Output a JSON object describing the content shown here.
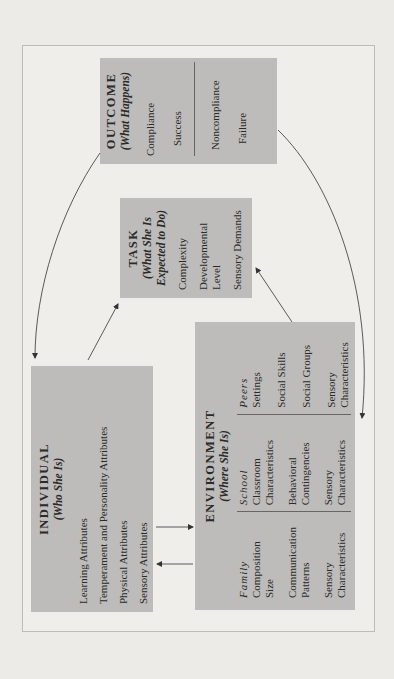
{
  "diagram": {
    "orientation": "rotated-90-ccw",
    "boxes": {
      "outcome": {
        "title": "OUTCOME",
        "subtitle": "(What Happens)",
        "positive": [
          "Compliance",
          "Success"
        ],
        "negative": [
          "Noncompliance",
          "Failure"
        ]
      },
      "task": {
        "title": "TASK",
        "subtitle_line1": "(What She Is",
        "subtitle_line2": "Expected to Do)",
        "items": [
          "Complexity",
          "Developmental",
          "Level",
          "Sensory Demands"
        ]
      },
      "individual": {
        "title": "INDIVIDUAL",
        "subtitle": "(Who She Is)",
        "items": [
          "Learning Attributes",
          "Temperament and Personality Attributes",
          "Physical Attributes",
          "Sensory Attributes"
        ]
      },
      "environment": {
        "title": "ENVIRONMENT",
        "subtitle": "(Where She Is)",
        "columns": [
          {
            "heading": "Family",
            "items": [
              "Composition",
              "Size",
              "Communication",
              "Patterns",
              "Sensory",
              "Characteristics"
            ]
          },
          {
            "heading": "School",
            "items": [
              "Classroom",
              "Characteristics",
              "Behavioral",
              "Contingencies",
              "Sensory",
              "Characteristics"
            ]
          },
          {
            "heading": "Peers",
            "items": [
              "Settings",
              "Social Skills",
              "Social Groups",
              "Sensory",
              "Characteristics"
            ]
          }
        ]
      }
    },
    "connections": [
      {
        "from": "individual",
        "to": "task"
      },
      {
        "from": "environment",
        "to": "task"
      },
      {
        "from": "individual",
        "to": "environment"
      },
      {
        "from": "environment",
        "to": "individual"
      },
      {
        "from": "outcome",
        "to": "individual"
      },
      {
        "from": "outcome",
        "to": "environment"
      }
    ],
    "colors": {
      "box_fill": "#bdbcba",
      "background": "#ecebe8",
      "frame": "#bdbcb8",
      "line": "#333333"
    }
  }
}
